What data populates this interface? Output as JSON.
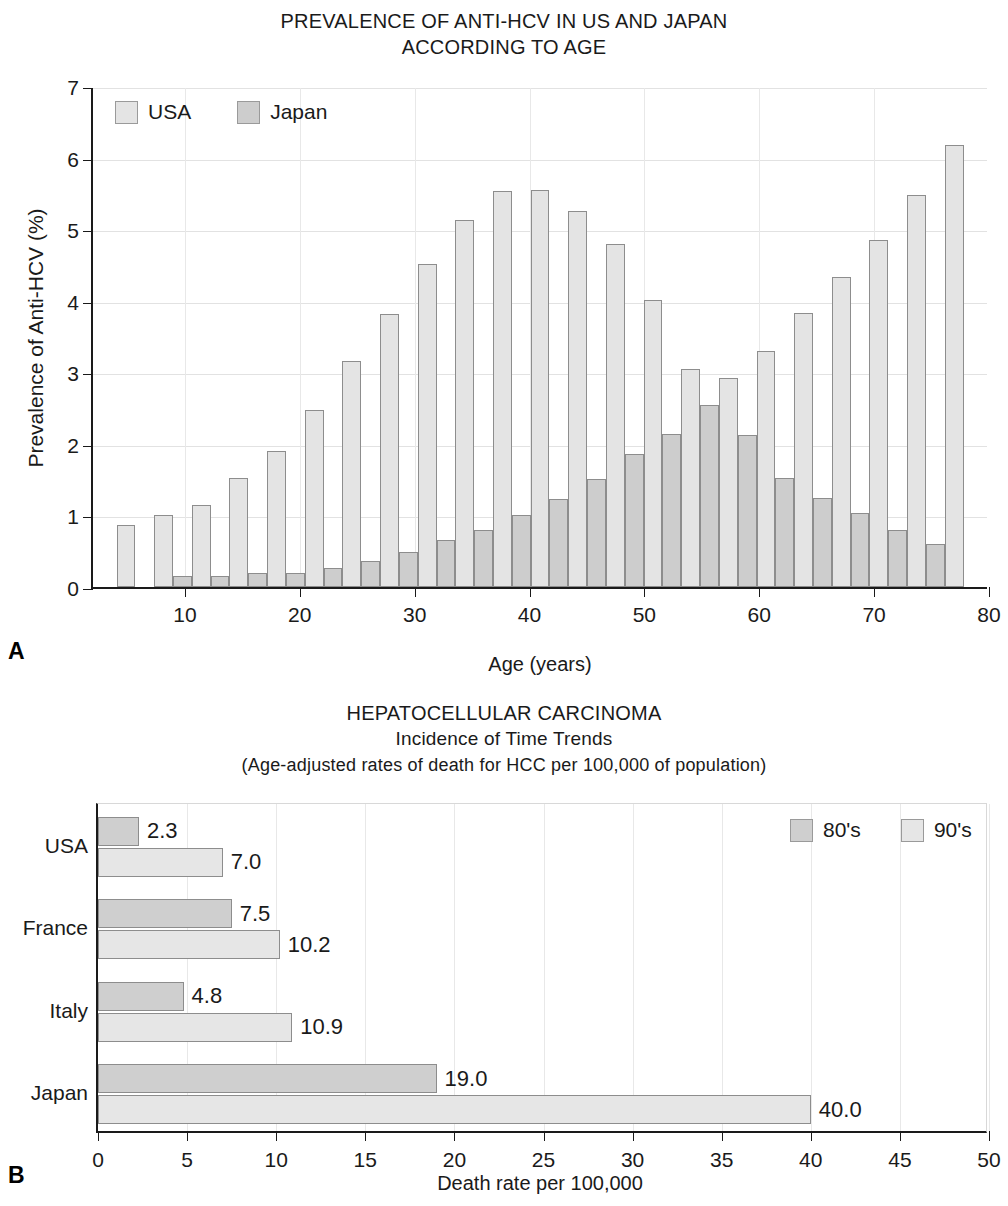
{
  "panelA": {
    "letter": "A",
    "title_line1": "PREVALENCE OF ANTI-HCV IN US AND JAPAN",
    "title_line2": "ACCORDING TO AGE",
    "legend": [
      {
        "label": "USA",
        "color": "#e4e4e4"
      },
      {
        "label": "Japan",
        "color": "#cdcdcd"
      }
    ]
  },
  "panelB": {
    "letter": "B",
    "title_line1": "HEPATOCELLULAR CARCINOMA",
    "title_line2": "Incidence of Time Trends",
    "title_line3": "(Age-adjusted rates of death for HCC per 100,000 of population)",
    "legend": [
      {
        "label": "80's",
        "color": "#cfcfcf"
      },
      {
        "label": "90's",
        "color": "#e6e6e6"
      }
    ]
  },
  "chart_data": [
    {
      "type": "bar",
      "title": "PREVALENCE OF ANTI-HCV IN US AND JAPAN ACCORDING TO AGE",
      "xlabel": "Age (years)",
      "ylabel": "Prevalence of Anti-HCV (%)",
      "xlim": [
        2,
        80
      ],
      "ylim": [
        0,
        7
      ],
      "yticks": [
        0,
        1,
        2,
        3,
        4,
        5,
        6,
        7
      ],
      "xticks": [
        10,
        20,
        30,
        40,
        50,
        60,
        70,
        80
      ],
      "grid": true,
      "legend_position": "top-left",
      "categories": [
        5,
        8.5,
        12,
        15.5,
        19,
        22.5,
        26,
        29.5,
        33,
        36.5,
        40,
        43.5,
        47,
        50.5,
        54,
        57.5,
        61,
        64.5,
        68,
        71.5,
        75
      ],
      "series": [
        {
          "name": "USA",
          "color": "#e4e4e4",
          "values": [
            0.87,
            1.0,
            1.14,
            1.52,
            1.9,
            2.47,
            3.16,
            3.81,
            4.52,
            5.13,
            5.54,
            5.55,
            5.25,
            4.79,
            4.01,
            3.04,
            2.92,
            3.3,
            3.83,
            4.33,
            4.85,
            5.48,
            6.17
          ]
        },
        {
          "name": "Japan",
          "color": "#cdcdcd",
          "values": [
            0.0,
            0.16,
            0.16,
            0.19,
            0.19,
            0.27,
            0.37,
            0.49,
            0.66,
            0.8,
            1.0,
            1.23,
            1.51,
            1.86,
            2.14,
            2.55,
            2.13,
            1.53,
            1.24,
            1.04,
            0.79,
            0.6,
            0.0
          ]
        }
      ]
    },
    {
      "type": "bar",
      "orientation": "horizontal",
      "title": "HEPATOCELLULAR CARCINOMA - Incidence of Time Trends",
      "subtitle": "(Age-adjusted rates of death for HCC per 100,000 of population)",
      "xlabel": "Death rate per 100,000",
      "ylabel": "",
      "xlim": [
        0,
        50
      ],
      "xticks": [
        0,
        5,
        10,
        15,
        20,
        25,
        30,
        35,
        40,
        45,
        50
      ],
      "grid": true,
      "legend_position": "top-right",
      "categories": [
        "USA",
        "France",
        "Italy",
        "Japan"
      ],
      "series": [
        {
          "name": "80's",
          "color": "#cfcfcf",
          "values": [
            2.3,
            7.5,
            4.8,
            19.0
          ],
          "labels": [
            "2.3",
            "7.5",
            "4.8",
            "19.0"
          ]
        },
        {
          "name": "90's",
          "color": "#e6e6e6",
          "values": [
            7.0,
            10.2,
            10.9,
            40.0
          ],
          "labels": [
            "7.0",
            "10.2",
            "10.9",
            "40.0"
          ]
        }
      ]
    }
  ]
}
